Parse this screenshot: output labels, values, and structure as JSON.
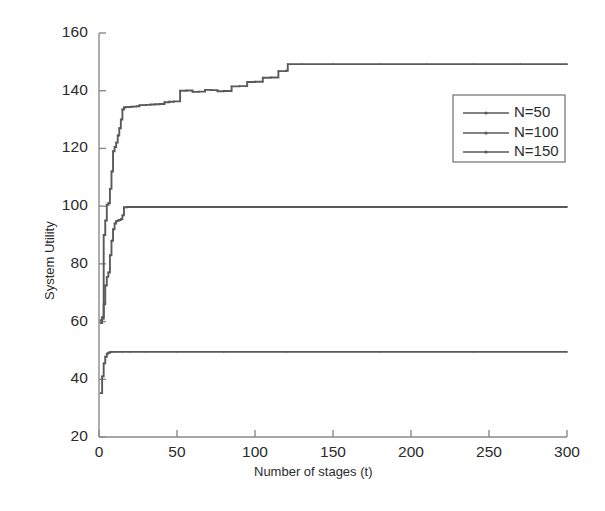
{
  "chart_data": {
    "type": "line",
    "title": "",
    "xlabel": "Number of stages (t)",
    "ylabel": "System Utility",
    "xlim": [
      0,
      300
    ],
    "ylim": [
      20,
      160
    ],
    "xticks": [
      0,
      50,
      100,
      150,
      200,
      250,
      300
    ],
    "yticks": [
      20,
      40,
      60,
      80,
      100,
      120,
      140,
      160
    ],
    "grid": false,
    "legend_position": "upper-right-inside",
    "legend_entries": [
      "N=50",
      "N=100",
      "N=150"
    ],
    "marker": "dot",
    "line_color": "#5a5a5a",
    "axis_color": "#8a8a8a",
    "series": [
      {
        "name": "N=50",
        "x": [
          1,
          2,
          3,
          4,
          5,
          6,
          7,
          8,
          10,
          12,
          15,
          20,
          30,
          50,
          80,
          120,
          180,
          240,
          300
        ],
        "values": [
          35.2,
          41.0,
          45.5,
          47.8,
          48.9,
          49.2,
          49.4,
          49.5,
          49.5,
          49.5,
          49.5,
          49.5,
          49.5,
          49.5,
          49.5,
          49.5,
          49.5,
          49.5,
          49.5
        ]
      },
      {
        "name": "N=100",
        "x": [
          1,
          2,
          3,
          4,
          5,
          6,
          7,
          8,
          9,
          10,
          11,
          12,
          13,
          14,
          15,
          16,
          18,
          20,
          25,
          30,
          40,
          60,
          100,
          150,
          200,
          250,
          300
        ],
        "values": [
          59.5,
          61.0,
          66.0,
          72.5,
          75.5,
          77.0,
          83.0,
          88.0,
          92.0,
          94.0,
          94.8,
          95.0,
          95.2,
          95.5,
          96.8,
          99.6,
          99.7,
          99.7,
          99.7,
          99.7,
          99.7,
          99.7,
          99.7,
          99.7,
          99.7,
          99.7,
          99.7
        ]
      },
      {
        "name": "N=150",
        "x": [
          1,
          2,
          3,
          4,
          5,
          6,
          7,
          8,
          9,
          10,
          11,
          12,
          13,
          14,
          15,
          16,
          17,
          18,
          19,
          20,
          21,
          22,
          24,
          26,
          28,
          30,
          33,
          36,
          39,
          42,
          45,
          48,
          52,
          56,
          60,
          64,
          68,
          72,
          76,
          80,
          85,
          90,
          95,
          100,
          105,
          110,
          115,
          120,
          121,
          130,
          150,
          180,
          210,
          240,
          270,
          300
        ],
        "values": [
          60.5,
          61.5,
          90.0,
          95.0,
          100.5,
          101.0,
          106.0,
          112.0,
          119.0,
          120.5,
          122.0,
          124.5,
          127.0,
          130.0,
          133.5,
          134.2,
          134.3,
          134.3,
          134.3,
          134.4,
          134.5,
          134.5,
          134.6,
          135.0,
          135.0,
          135.1,
          135.2,
          135.3,
          135.4,
          136.0,
          136.2,
          136.3,
          140.0,
          140.1,
          139.6,
          139.7,
          140.3,
          140.2,
          139.8,
          139.9,
          141.5,
          141.6,
          143.0,
          143.1,
          144.5,
          144.6,
          146.8,
          146.9,
          149.2,
          149.2,
          149.2,
          149.2,
          149.2,
          149.2,
          149.2,
          149.2
        ]
      }
    ]
  },
  "axes": {
    "x_tick_labels": [
      "0",
      "50",
      "100",
      "150",
      "200",
      "250",
      "300"
    ],
    "y_tick_labels": [
      "20",
      "40",
      "60",
      "80",
      "100",
      "120",
      "140",
      "160"
    ],
    "x_title": "Number of stages (t)",
    "y_title": "System Utility"
  },
  "legend": {
    "items": [
      {
        "label": "N=50"
      },
      {
        "label": "N=100"
      },
      {
        "label": "N=150"
      }
    ]
  }
}
